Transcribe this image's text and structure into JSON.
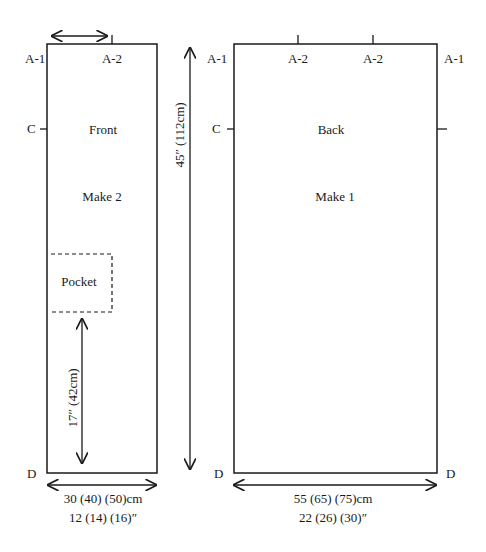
{
  "front": {
    "title": "Front",
    "instruction": "Make 2",
    "pocket_label": "Pocket",
    "labels": {
      "top_left": "A-1",
      "top_mid": "A-2",
      "side_mark": "C",
      "bottom_left": "D"
    },
    "width_cm": "30 (40) (50)cm",
    "width_in": "12 (14) (16)″",
    "pocket_height": "17″ (42cm)"
  },
  "length": "45″ (112cm)",
  "back": {
    "title": "Back",
    "instruction": "Make 1",
    "labels": {
      "top_left": "A-1",
      "top_mid_1": "A-2",
      "top_mid_2": "A-2",
      "top_right": "A-1",
      "side_mark": "C",
      "bottom_left": "D",
      "bottom_right": "D"
    },
    "width_cm": "55 (65) (75)cm",
    "width_in": "22 (26) (30)″"
  },
  "colors": {
    "line": "#1a1a1a",
    "background": "#ffffff"
  }
}
